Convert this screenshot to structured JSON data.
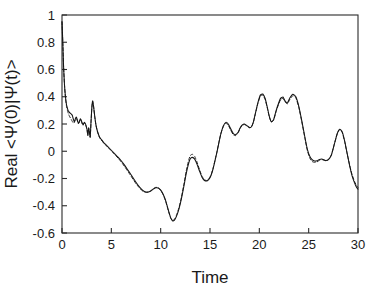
{
  "chart_data": {
    "type": "line",
    "title": "",
    "xlabel": "Time",
    "ylabel": "Real <Ψ(0)|Ψ(t)>",
    "xlim": [
      0,
      30
    ],
    "ylim": [
      -0.6,
      1.0
    ],
    "xticks": [
      0,
      5,
      10,
      15,
      20,
      25,
      30
    ],
    "xtick_labels": [
      "0",
      "5",
      "10",
      "15",
      "20",
      "25",
      "30"
    ],
    "yticks": [
      -0.6,
      -0.4,
      -0.2,
      0,
      0.2,
      0.4,
      0.6,
      0.8,
      1.0
    ],
    "ytick_labels": [
      "-0.6",
      "-0.4",
      "-0.2",
      "0",
      "0.2",
      "0.4",
      "0.6",
      "0.8",
      "1"
    ],
    "grid": false,
    "legend": null,
    "legend_position": "none",
    "colors": {
      "solid_series": "#141414",
      "dashed_series": "#2a2a2a",
      "axis": "#2b2b2b",
      "background": "#ffffff"
    },
    "series": [
      {
        "name": "solid",
        "style": "solid",
        "x": [
          0.0,
          0.08,
          0.16,
          0.25,
          0.35,
          0.45,
          0.55,
          0.65,
          0.75,
          0.85,
          0.95,
          1.05,
          1.15,
          1.25,
          1.35,
          1.45,
          1.55,
          1.65,
          1.75,
          1.85,
          1.95,
          2.05,
          2.15,
          2.25,
          2.35,
          2.45,
          2.55,
          2.62,
          2.7,
          2.78,
          2.86,
          2.94,
          3.02,
          3.1,
          3.2,
          3.32,
          3.45,
          3.6,
          3.8,
          4.0,
          4.25,
          4.5,
          4.8,
          5.1,
          5.4,
          5.7,
          6.0,
          6.3,
          6.6,
          6.9,
          7.2,
          7.5,
          7.8,
          8.1,
          8.4,
          8.7,
          9.0,
          9.25,
          9.5,
          9.75,
          10.0,
          10.25,
          10.5,
          10.75,
          11.0,
          11.2,
          11.4,
          11.6,
          11.85,
          12.1,
          12.35,
          12.6,
          12.85,
          13.0,
          13.2,
          13.45,
          13.7,
          13.95,
          14.2,
          14.45,
          14.7,
          14.9,
          15.1,
          15.3,
          15.5,
          15.7,
          15.9,
          16.1,
          16.35,
          16.6,
          16.85,
          17.1,
          17.35,
          17.6,
          17.85,
          18.05,
          18.25,
          18.5,
          18.75,
          19.0,
          19.2,
          19.4,
          19.6,
          19.85,
          20.1,
          20.35,
          20.6,
          20.8,
          21.0,
          21.2,
          21.45,
          21.7,
          21.95,
          22.15,
          22.4,
          22.6,
          22.85,
          23.1,
          23.4,
          23.7,
          24.0,
          24.3,
          24.6,
          24.85,
          25.1,
          25.35,
          25.6,
          25.85,
          26.1,
          26.4,
          26.7,
          27.0,
          27.3,
          27.6,
          27.9,
          28.15,
          28.4,
          28.65,
          28.9,
          29.15,
          29.4,
          29.65,
          29.85,
          30.0
        ],
        "y": [
          0.95,
          0.8,
          0.62,
          0.49,
          0.4,
          0.345,
          0.315,
          0.295,
          0.285,
          0.278,
          0.272,
          0.262,
          0.235,
          0.215,
          0.238,
          0.252,
          0.232,
          0.205,
          0.215,
          0.238,
          0.228,
          0.205,
          0.195,
          0.212,
          0.205,
          0.185,
          0.155,
          0.118,
          0.172,
          0.14,
          0.105,
          0.215,
          0.315,
          0.37,
          0.33,
          0.255,
          0.19,
          0.145,
          0.105,
          0.085,
          0.062,
          0.045,
          0.022,
          0.0,
          -0.022,
          -0.045,
          -0.07,
          -0.098,
          -0.13,
          -0.162,
          -0.195,
          -0.228,
          -0.258,
          -0.282,
          -0.298,
          -0.3,
          -0.292,
          -0.278,
          -0.268,
          -0.27,
          -0.285,
          -0.315,
          -0.36,
          -0.425,
          -0.485,
          -0.51,
          -0.505,
          -0.478,
          -0.425,
          -0.35,
          -0.258,
          -0.16,
          -0.085,
          -0.055,
          -0.045,
          -0.058,
          -0.098,
          -0.148,
          -0.192,
          -0.215,
          -0.218,
          -0.205,
          -0.178,
          -0.132,
          -0.072,
          -0.008,
          0.062,
          0.128,
          0.185,
          0.212,
          0.2,
          0.165,
          0.132,
          0.122,
          0.14,
          0.17,
          0.192,
          0.2,
          0.188,
          0.175,
          0.18,
          0.215,
          0.278,
          0.355,
          0.412,
          0.42,
          0.385,
          0.325,
          0.26,
          0.218,
          0.232,
          0.298,
          0.352,
          0.388,
          0.398,
          0.37,
          0.355,
          0.392,
          0.418,
          0.4,
          0.33,
          0.225,
          0.11,
          0.02,
          -0.035,
          -0.062,
          -0.072,
          -0.07,
          -0.06,
          -0.058,
          -0.068,
          -0.062,
          -0.028,
          0.052,
          0.13,
          0.162,
          0.142,
          0.075,
          -0.015,
          -0.105,
          -0.18,
          -0.232,
          -0.265,
          -0.278
        ],
        "note_segments": [
          {
            "range": [
              23.0,
              25.0
            ],
            "y_override": [
              0.418,
              0.4,
              0.33,
              0.225,
              0.11,
              0.02,
              -0.035,
              -0.062
            ]
          }
        ]
      },
      {
        "name": "dashed",
        "style": "dashed",
        "x": [
          0.0,
          0.08,
          0.16,
          0.25,
          0.35,
          0.45,
          0.55,
          0.65,
          0.75,
          0.85,
          0.95,
          1.05,
          1.15,
          1.25,
          1.35,
          1.45,
          1.55,
          1.65,
          1.75,
          1.85,
          1.95,
          2.05,
          2.15,
          2.25,
          2.35,
          2.45,
          2.55,
          2.62,
          2.7,
          2.78,
          2.86,
          2.94,
          3.02,
          3.1,
          3.2,
          3.32,
          3.45,
          3.6,
          3.8,
          4.0,
          4.25,
          4.5,
          4.8,
          5.1,
          5.4,
          5.7,
          6.0,
          6.3,
          6.6,
          6.9,
          7.2,
          7.5,
          7.8,
          8.1,
          8.4,
          8.7,
          9.0,
          9.25,
          9.5,
          9.75,
          10.0,
          10.25,
          10.5,
          10.75,
          11.0,
          11.2,
          11.4,
          11.6,
          11.85,
          12.1,
          12.35,
          12.6,
          12.85,
          13.0,
          13.2,
          13.45,
          13.7,
          13.95,
          14.2,
          14.45,
          14.7,
          14.9,
          15.1,
          15.3,
          15.5,
          15.7,
          15.9,
          16.1,
          16.35,
          16.6,
          16.85,
          17.1,
          17.35,
          17.6,
          17.85,
          18.05,
          18.25,
          18.5,
          18.75,
          19.0,
          19.2,
          19.4,
          19.6,
          19.85,
          20.1,
          20.35,
          20.6,
          20.8,
          21.0,
          21.2,
          21.45,
          21.7,
          21.95,
          22.15,
          22.4,
          22.6,
          22.85,
          23.1,
          23.4,
          23.7,
          24.0,
          24.3,
          24.6,
          24.85,
          25.1,
          25.35,
          25.6,
          25.85,
          26.1,
          26.4,
          26.7,
          27.0,
          27.3,
          27.6,
          27.9,
          28.15,
          28.4,
          28.65,
          28.9,
          29.15,
          29.4,
          29.65,
          29.85,
          30.0
        ],
        "y": [
          0.95,
          0.8,
          0.62,
          0.49,
          0.395,
          0.335,
          0.3,
          0.275,
          0.258,
          0.245,
          0.232,
          0.218,
          0.205,
          0.212,
          0.23,
          0.24,
          0.225,
          0.205,
          0.212,
          0.232,
          0.222,
          0.202,
          0.192,
          0.208,
          0.202,
          0.182,
          0.15,
          0.115,
          0.168,
          0.138,
          0.102,
          0.212,
          0.312,
          0.368,
          0.328,
          0.252,
          0.188,
          0.142,
          0.102,
          0.082,
          0.058,
          0.04,
          0.018,
          -0.005,
          -0.028,
          -0.052,
          -0.078,
          -0.108,
          -0.14,
          -0.172,
          -0.205,
          -0.238,
          -0.265,
          -0.288,
          -0.3,
          -0.3,
          -0.29,
          -0.275,
          -0.265,
          -0.268,
          -0.285,
          -0.318,
          -0.365,
          -0.43,
          -0.488,
          -0.508,
          -0.5,
          -0.47,
          -0.415,
          -0.338,
          -0.242,
          -0.142,
          -0.062,
          -0.032,
          -0.022,
          -0.038,
          -0.082,
          -0.138,
          -0.185,
          -0.21,
          -0.215,
          -0.202,
          -0.175,
          -0.128,
          -0.068,
          -0.005,
          0.065,
          0.13,
          0.182,
          0.205,
          0.192,
          0.155,
          0.122,
          0.115,
          0.135,
          0.168,
          0.19,
          0.196,
          0.185,
          0.172,
          0.178,
          0.212,
          0.275,
          0.35,
          0.405,
          0.412,
          0.378,
          0.32,
          0.256,
          0.215,
          0.228,
          0.292,
          0.345,
          0.378,
          0.388,
          0.362,
          0.348,
          0.382,
          0.408,
          0.392,
          0.322,
          0.218,
          0.102,
          0.01,
          -0.048,
          -0.075,
          -0.082,
          -0.078,
          -0.066,
          -0.062,
          -0.07,
          -0.062,
          -0.028,
          0.052,
          0.13,
          0.16,
          0.138,
          0.07,
          -0.018,
          -0.1,
          -0.172,
          -0.222,
          -0.252,
          -0.265
        ]
      }
    ]
  },
  "axis": {
    "xlabel": "Time",
    "ylabel": "Real <Ψ(0)|Ψ(t)>"
  }
}
